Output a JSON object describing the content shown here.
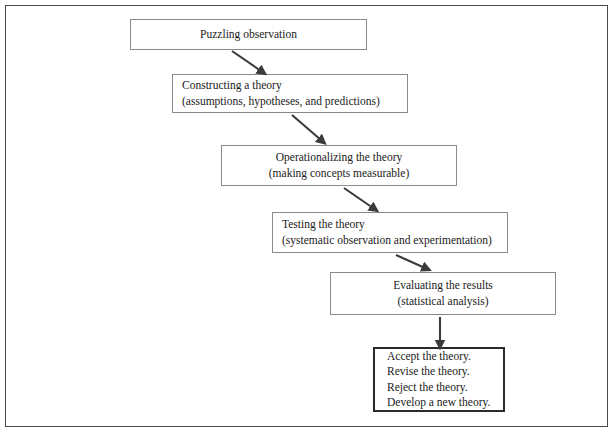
{
  "figure": {
    "frame": {
      "visible": true,
      "color": "#4a4a4a"
    },
    "box_border_color": "#8a8a8a",
    "terminal_border_color": "#2b2b2b",
    "arrow_color": "#3b3b3b",
    "background": "#ffffff"
  },
  "nodes": [
    {
      "id": "puzzling-observation",
      "lines": [
        "Puzzling observation"
      ],
      "align": "center",
      "x": 130,
      "y": 19,
      "w": 237,
      "h": 31
    },
    {
      "id": "constructing-a-theory",
      "lines": [
        "Constructing a theory",
        "(assumptions, hypotheses, and predictions)"
      ],
      "align": "left",
      "x": 172,
      "y": 74,
      "w": 236,
      "h": 39
    },
    {
      "id": "operationalizing-the-theory",
      "lines": [
        "Operationalizing the theory",
        "(making concepts measurable)"
      ],
      "align": "center",
      "x": 221,
      "y": 145,
      "w": 236,
      "h": 41
    },
    {
      "id": "testing-the-theory",
      "lines": [
        "Testing the theory",
        "(systematic observation and experimentation)"
      ],
      "align": "left",
      "x": 272,
      "y": 212,
      "w": 236,
      "h": 41
    },
    {
      "id": "evaluating-the-results",
      "lines": [
        "Evaluating the results",
        "(statistical analysis)"
      ],
      "align": "center",
      "x": 330,
      "y": 272,
      "w": 226,
      "h": 43
    },
    {
      "id": "outcomes",
      "lines": [
        "Accept the theory.",
        "Revise the theory.",
        "Reject the theory.",
        "Develop a new theory."
      ],
      "align": "left",
      "terminal": true,
      "x": 373,
      "y": 347,
      "w": 132,
      "h": 65
    }
  ],
  "arrows": [
    {
      "id": "arrow-1",
      "from": "puzzling-observation",
      "to": "constructing-a-theory",
      "kind": "diagonal",
      "x1": 232,
      "y1": 51,
      "x2": 262,
      "y2": 72
    },
    {
      "id": "arrow-2",
      "from": "constructing-a-theory",
      "to": "operationalizing-the-theory",
      "kind": "diagonal",
      "x1": 292,
      "y1": 115,
      "x2": 322,
      "y2": 141
    },
    {
      "id": "arrow-3",
      "from": "operationalizing-the-theory",
      "to": "testing-the-theory",
      "kind": "diagonal",
      "x1": 344,
      "y1": 188,
      "x2": 374,
      "y2": 209
    },
    {
      "id": "arrow-4",
      "from": "testing-the-theory",
      "to": "evaluating-the-results",
      "kind": "diagonal",
      "x1": 396,
      "y1": 255,
      "x2": 426,
      "y2": 269
    },
    {
      "id": "arrow-5",
      "from": "evaluating-the-results",
      "to": "outcomes",
      "kind": "vertical",
      "x1": 440,
      "y1": 317,
      "x2": 440,
      "y2": 344
    }
  ]
}
